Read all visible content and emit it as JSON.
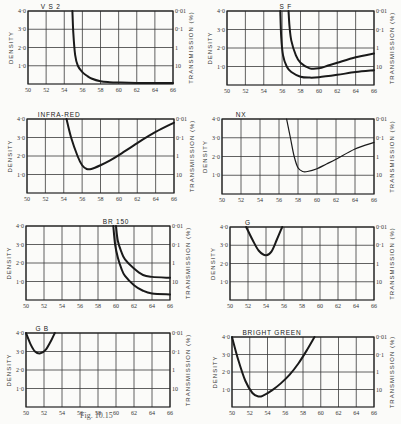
{
  "figure": {
    "caption": "Fig. 10.15"
  },
  "chart_data": [
    {
      "type": "line",
      "title": "V S 2",
      "xlabel": "",
      "ylabel": "DENSITY",
      "y2label": "TRANSMISSION (%)",
      "xlim": [
        50,
        66
      ],
      "ylim": [
        0,
        4
      ],
      "xticks": [
        "50",
        "52",
        "54",
        "56",
        "58",
        "60",
        "62",
        "64",
        "66"
      ],
      "yticks": [
        "1·0",
        "2·0",
        "3·0",
        "4·0"
      ],
      "y2ticks": [
        "10",
        "1",
        "0·1",
        "0·01"
      ],
      "grid": true,
      "series": [
        {
          "name": "VS2",
          "x": [
            54.9,
            55.0,
            55.2,
            55.5,
            56.0,
            56.5,
            57.0,
            58.0,
            59.0,
            60.0,
            62.0,
            66.0
          ],
          "y": [
            4.0,
            2.8,
            1.6,
            1.0,
            0.65,
            0.45,
            0.3,
            0.15,
            0.1,
            0.08,
            0.06,
            0.05
          ]
        }
      ],
      "frame": {
        "x": 28,
        "y": 11,
        "w": 145,
        "h": 73
      }
    },
    {
      "type": "line",
      "title": "S F",
      "xlabel": "",
      "ylabel": "DENSITY",
      "y2label": "TRANSMISSION (%)",
      "xlim": [
        50,
        66
      ],
      "ylim": [
        0,
        4
      ],
      "xticks": [
        "50",
        "52",
        "54",
        "56",
        "58",
        "60",
        "62",
        "64",
        "66"
      ],
      "yticks": [
        "1·0",
        "2·0",
        "3·0",
        "4·0"
      ],
      "y2ticks": [
        "10",
        "1",
        "0·1",
        "0·01"
      ],
      "grid": true,
      "series": [
        {
          "name": "S",
          "x": [
            55.8,
            55.9,
            56.1,
            56.5,
            57.0,
            58.0,
            59.0,
            60.0,
            62.0,
            64.0,
            66.0
          ],
          "y": [
            4.0,
            2.6,
            1.6,
            1.0,
            0.7,
            0.45,
            0.4,
            0.42,
            0.55,
            0.7,
            0.8
          ]
        },
        {
          "name": "F",
          "x": [
            56.7,
            56.8,
            57.0,
            57.5,
            58.0,
            59.0,
            60.0,
            61.0,
            62.0,
            64.0,
            66.0
          ],
          "y": [
            4.0,
            3.2,
            2.4,
            1.6,
            1.2,
            0.9,
            0.9,
            1.05,
            1.2,
            1.5,
            1.7
          ]
        }
      ],
      "frame": {
        "x": 227,
        "y": 11,
        "w": 147,
        "h": 74
      }
    },
    {
      "type": "line",
      "title": "INFRA-RED",
      "xlabel": "",
      "ylabel": "DENSITY",
      "y2label": "TRANSMISSION (%)",
      "xlim": [
        50,
        66
      ],
      "ylim": [
        0,
        4
      ],
      "xticks": [
        "50",
        "52",
        "54",
        "56",
        "58",
        "60",
        "62",
        "64",
        "66"
      ],
      "yticks": [
        "1·0",
        "2·0",
        "3·0",
        "4·0"
      ],
      "y2ticks": [
        "10",
        "1",
        "0·1",
        "0·01"
      ],
      "grid": true,
      "series": [
        {
          "name": "Infra-red",
          "x": [
            54.3,
            54.8,
            55.5,
            56.0,
            56.5,
            57.0,
            58.0,
            59.0,
            60.0,
            62.0,
            64.0,
            66.0
          ],
          "y": [
            4.0,
            3.0,
            2.0,
            1.5,
            1.3,
            1.3,
            1.5,
            1.75,
            2.05,
            2.7,
            3.3,
            3.8
          ]
        }
      ],
      "frame": {
        "x": 27,
        "y": 119,
        "w": 147,
        "h": 74
      }
    },
    {
      "type": "line",
      "title": "NX",
      "xlabel": "",
      "ylabel": "DENSITY",
      "y2label": "TRANSMISSION (%)",
      "xlim": [
        50,
        66
      ],
      "ylim": [
        0,
        4
      ],
      "xticks": [
        "50",
        "52",
        "54",
        "56",
        "58",
        "60",
        "62",
        "64",
        "66"
      ],
      "yticks": [
        "1·0",
        "2·0",
        "3·0",
        "4·0"
      ],
      "y2ticks": [
        "10",
        "1",
        "0·1",
        "0·01"
      ],
      "grid": true,
      "series": [
        {
          "name": "NX",
          "x": [
            56.8,
            57.2,
            57.6,
            58.0,
            58.5,
            59.0,
            60.0,
            61.0,
            62.0,
            64.0,
            66.0
          ],
          "y": [
            4.0,
            3.0,
            2.0,
            1.4,
            1.2,
            1.2,
            1.35,
            1.6,
            1.85,
            2.4,
            2.75
          ]
        }
      ],
      "frame": {
        "x": 222,
        "y": 119,
        "w": 152,
        "h": 75
      }
    },
    {
      "type": "line",
      "title": "BR 150",
      "xlabel": "",
      "ylabel": "DENSITY",
      "y2label": "TRANSMISSION (%)",
      "xlim": [
        50,
        66
      ],
      "ylim": [
        0,
        4
      ],
      "xticks": [
        "50",
        "52",
        "54",
        "56",
        "58",
        "60",
        "62",
        "64",
        "66"
      ],
      "yticks": [
        "1·0",
        "2·0",
        "3·0",
        "4·0"
      ],
      "y2ticks": [
        "10",
        "1",
        "0·1",
        "0·01"
      ],
      "grid": true,
      "series": [
        {
          "name": "BR 150 (upper)",
          "x": [
            60.0,
            60.2,
            60.6,
            61.0,
            62.0,
            63.0,
            64.0,
            66.0
          ],
          "y": [
            4.0,
            3.2,
            2.6,
            2.2,
            1.7,
            1.35,
            1.25,
            1.2
          ]
        },
        {
          "name": "BR 150 (lower)",
          "x": [
            59.7,
            59.9,
            60.2,
            60.6,
            61.0,
            62.0,
            63.0,
            64.0,
            66.0
          ],
          "y": [
            4.0,
            3.0,
            2.3,
            1.7,
            1.3,
            0.8,
            0.5,
            0.35,
            0.3
          ]
        }
      ],
      "frame": {
        "x": 26,
        "y": 226,
        "w": 144,
        "h": 74
      }
    },
    {
      "type": "line",
      "title": "G",
      "xlabel": "",
      "ylabel": "DENSITY",
      "y2label": "TRANSMISSION (%)",
      "xlim": [
        50,
        66
      ],
      "ylim": [
        0,
        4
      ],
      "xticks": [
        "50",
        "52",
        "54",
        "56",
        "58",
        "60",
        "62",
        "64",
        "66"
      ],
      "yticks": [
        "1·0",
        "2·0",
        "3·0",
        "4·0"
      ],
      "y2ticks": [
        "10",
        "1",
        "0·1",
        "0·01"
      ],
      "grid": true,
      "series": [
        {
          "name": "G",
          "x": [
            51.8,
            52.5,
            53.2,
            54.0,
            54.6,
            55.2,
            55.8
          ],
          "y": [
            4.0,
            3.3,
            2.7,
            2.45,
            2.65,
            3.3,
            4.0
          ]
        }
      ],
      "frame": {
        "x": 230,
        "y": 227,
        "w": 144,
        "h": 73
      }
    },
    {
      "type": "line",
      "title": "G B",
      "xlabel": "",
      "ylabel": "DENSITY",
      "y2label": "TRANSMISSION (%)",
      "xlim": [
        50,
        66
      ],
      "ylim": [
        0,
        4
      ],
      "xticks": [
        "50",
        "52",
        "54",
        "56",
        "58",
        "60",
        "62",
        "64",
        "66"
      ],
      "yticks": [
        "1·0",
        "2·0",
        "3·0",
        "4·0"
      ],
      "y2ticks": [
        "10",
        "1",
        "0·1",
        "0·01"
      ],
      "grid": true,
      "series": [
        {
          "name": "GB",
          "x": [
            50.0,
            50.5,
            51.0,
            51.6,
            52.2,
            52.8,
            53.2
          ],
          "y": [
            4.0,
            3.4,
            3.0,
            2.9,
            3.1,
            3.6,
            4.0
          ]
        }
      ],
      "frame": {
        "x": 26,
        "y": 333,
        "w": 144,
        "h": 74
      }
    },
    {
      "type": "line",
      "title": "BRIGHT GREEN",
      "xlabel": "",
      "ylabel": "DENSITY",
      "y2label": "TRANSMISSION (%)",
      "xlim": [
        50,
        66
      ],
      "ylim": [
        0,
        4
      ],
      "xticks": [
        "50",
        "52",
        "54",
        "56",
        "58",
        "60",
        "62",
        "64",
        "66"
      ],
      "yticks": [
        "1·0",
        "2·0",
        "3·0",
        "4·0"
      ],
      "y2ticks": [
        "10",
        "1",
        "0·1",
        "0·01"
      ],
      "grid": true,
      "series": [
        {
          "name": "Bright Green",
          "x": [
            50.0,
            50.7,
            51.5,
            52.3,
            53.0,
            53.5,
            54.5,
            55.5,
            56.5,
            57.5,
            58.5,
            59.3
          ],
          "y": [
            4.0,
            2.7,
            1.5,
            0.8,
            0.6,
            0.65,
            0.95,
            1.35,
            1.85,
            2.5,
            3.3,
            4.0
          ]
        }
      ],
      "frame": {
        "x": 232,
        "y": 337,
        "w": 142,
        "h": 70
      }
    }
  ]
}
